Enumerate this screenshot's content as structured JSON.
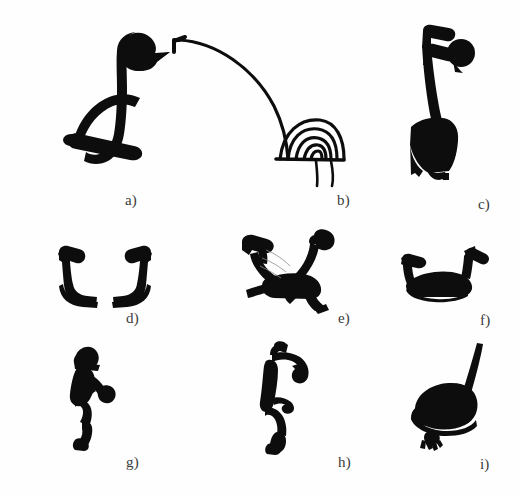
{
  "plate": {
    "background_color": "#fefefe",
    "ink_color": "#0d0d0d",
    "caption_color": "#3a3a3a",
    "width": 521,
    "height": 495,
    "columns": 3,
    "rows": 3
  },
  "figures": [
    {
      "id": "a",
      "caption": "a)",
      "subject": "long-necked bird with arched open body",
      "style": "thick-outline",
      "row": 1,
      "column": 1
    },
    {
      "id": "b",
      "caption": "b)",
      "subject": "bird with long arcing neck and concentric-arc body on two legs",
      "style": "thin-line",
      "row": 1,
      "column": 2
    },
    {
      "id": "c",
      "caption": "c)",
      "subject": "standing bird with hooked crest, round eye blob and solid wedge body",
      "style": "solid-fill",
      "row": 1,
      "column": 3
    },
    {
      "id": "d",
      "caption": "d)",
      "subject": "pair of mirrored hook shapes facing each other",
      "style": "thick-stroke",
      "row": 2,
      "column": 1
    },
    {
      "id": "e",
      "caption": "e)",
      "subject": "two-headed quadruped with hooked necks and splayed legs",
      "style": "thick-stroke",
      "row": 2,
      "column": 2
    },
    {
      "id": "f",
      "caption": "f)",
      "subject": "two-headed creature with low filled body and two hooked necks",
      "style": "thick-stroke",
      "row": 2,
      "column": 3
    },
    {
      "id": "g",
      "caption": "g)",
      "subject": "crouching human figure with pointed head and raised bent arm",
      "style": "solid-fill",
      "row": 3,
      "column": 1
    },
    {
      "id": "h",
      "caption": "h)",
      "subject": "standing human figure with outstretched arms and bent legs",
      "style": "solid-fill",
      "row": 3,
      "column": 2
    },
    {
      "id": "i",
      "caption": "i)",
      "subject": "solid bird body with thin upswept neck and clawed foot",
      "style": "solid-fill",
      "row": 3,
      "column": 3
    }
  ]
}
